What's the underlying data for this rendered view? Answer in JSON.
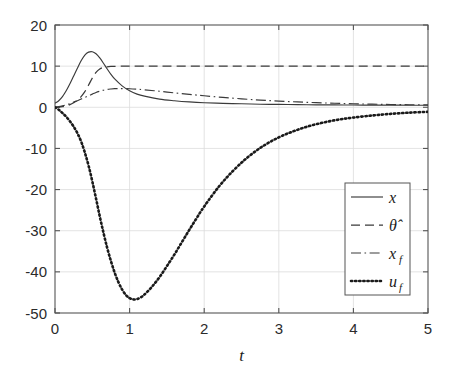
{
  "chart_data": {
    "type": "line",
    "title": "",
    "xlabel": "t",
    "ylabel": "",
    "xlim": [
      0,
      5
    ],
    "ylim": [
      -50,
      20
    ],
    "xticks": [
      "0",
      "1",
      "2",
      "3",
      "4",
      "5"
    ],
    "yticks": [
      "20",
      "10",
      "0",
      "-10",
      "-20",
      "-30",
      "-40",
      "-50"
    ],
    "xtick_values": [
      0,
      1,
      2,
      3,
      4,
      5
    ],
    "ytick_values": [
      20,
      10,
      0,
      -10,
      -20,
      -30,
      -40,
      -50
    ],
    "grid": true,
    "legend_position": "lower right",
    "series": [
      {
        "name": "x",
        "label": "x",
        "style": "solid",
        "color": "#3a3a3a",
        "x": [
          0,
          0.05,
          0.1,
          0.15,
          0.2,
          0.25,
          0.3,
          0.35,
          0.4,
          0.45,
          0.5,
          0.55,
          0.6,
          0.65,
          0.7,
          0.75,
          0.8,
          0.9,
          1.0,
          1.1,
          1.2,
          1.4,
          1.6,
          1.8,
          2.0,
          2.25,
          2.5,
          2.75,
          3.0,
          3.25,
          3.5,
          3.75,
          4.0,
          4.25,
          4.5,
          4.75,
          5.0
        ],
        "y": [
          1.0,
          1.6,
          2.6,
          4.0,
          5.7,
          7.6,
          9.5,
          11.3,
          12.7,
          13.4,
          13.5,
          13.0,
          12.0,
          10.7,
          9.3,
          8.0,
          6.9,
          5.2,
          4.0,
          3.2,
          2.7,
          2.0,
          1.6,
          1.3,
          1.1,
          0.95,
          0.85,
          0.75,
          0.7,
          0.65,
          0.6,
          0.58,
          0.55,
          0.53,
          0.52,
          0.5,
          0.5
        ]
      },
      {
        "name": "theta_hat",
        "label": "θ̂",
        "style": "dashed",
        "color": "#3a3a3a",
        "x": [
          0,
          0.05,
          0.1,
          0.15,
          0.2,
          0.25,
          0.3,
          0.35,
          0.4,
          0.45,
          0.5,
          0.55,
          0.6,
          0.65,
          0.7,
          0.75,
          0.8,
          0.9,
          1.0,
          1.25,
          1.5,
          2.0,
          2.5,
          3.0,
          3.5,
          4.0,
          4.5,
          5.0
        ],
        "y": [
          0.0,
          0.05,
          0.15,
          0.35,
          0.65,
          1.1,
          1.7,
          2.6,
          3.8,
          5.4,
          7.1,
          8.5,
          9.3,
          9.7,
          9.85,
          9.92,
          9.95,
          9.98,
          10.0,
          10.0,
          10.0,
          10.0,
          10.0,
          10.0,
          10.0,
          10.0,
          10.0,
          10.0
        ]
      },
      {
        "name": "x_f",
        "label": "x",
        "label_sub": "f",
        "style": "dashdot",
        "color": "#3a3a3a",
        "x": [
          0,
          0.05,
          0.1,
          0.15,
          0.2,
          0.25,
          0.3,
          0.35,
          0.4,
          0.45,
          0.5,
          0.55,
          0.6,
          0.65,
          0.7,
          0.75,
          0.8,
          0.85,
          0.9,
          1.0,
          1.1,
          1.2,
          1.4,
          1.6,
          1.8,
          2.0,
          2.25,
          2.5,
          2.75,
          3.0,
          3.25,
          3.5,
          3.75,
          4.0,
          4.25,
          4.5,
          4.75,
          5.0
        ],
        "y": [
          0.0,
          0.15,
          0.35,
          0.6,
          0.9,
          1.25,
          1.6,
          2.0,
          2.4,
          2.8,
          3.2,
          3.6,
          3.9,
          4.15,
          4.35,
          4.45,
          4.52,
          4.55,
          4.55,
          4.5,
          4.4,
          4.25,
          3.9,
          3.5,
          3.15,
          2.8,
          2.4,
          2.05,
          1.75,
          1.5,
          1.3,
          1.12,
          0.98,
          0.85,
          0.76,
          0.68,
          0.62,
          0.6
        ]
      },
      {
        "name": "u_f",
        "label": "u",
        "label_sub": "f",
        "style": "dotted",
        "color": "#1a1a1a",
        "x": [
          0,
          0.05,
          0.1,
          0.15,
          0.2,
          0.25,
          0.3,
          0.35,
          0.4,
          0.45,
          0.5,
          0.55,
          0.6,
          0.65,
          0.7,
          0.75,
          0.8,
          0.85,
          0.9,
          0.95,
          1.0,
          1.05,
          1.1,
          1.15,
          1.2,
          1.3,
          1.4,
          1.5,
          1.6,
          1.7,
          1.8,
          1.9,
          2.0,
          2.2,
          2.4,
          2.6,
          2.8,
          3.0,
          3.2,
          3.4,
          3.6,
          3.8,
          4.0,
          4.25,
          4.5,
          4.75,
          5.0
        ],
        "y": [
          0.0,
          -0.6,
          -1.4,
          -2.3,
          -3.4,
          -4.7,
          -6.3,
          -8.3,
          -11.0,
          -14.2,
          -18.0,
          -22.2,
          -26.5,
          -30.5,
          -34.2,
          -37.4,
          -40.2,
          -42.5,
          -44.3,
          -45.6,
          -46.4,
          -46.7,
          -46.6,
          -46.2,
          -45.5,
          -43.6,
          -41.3,
          -38.6,
          -35.8,
          -32.8,
          -29.8,
          -26.9,
          -24.1,
          -19.2,
          -15.2,
          -11.9,
          -9.3,
          -7.3,
          -5.8,
          -4.6,
          -3.7,
          -3.0,
          -2.5,
          -2.0,
          -1.6,
          -1.3,
          -1.1
        ]
      }
    ],
    "legend_entries": [
      {
        "label": "x",
        "sub": "",
        "style": "solid"
      },
      {
        "label": "θ̂",
        "sub": "",
        "style": "dashed"
      },
      {
        "label": "x",
        "sub": "f",
        "style": "dashdot"
      },
      {
        "label": "u",
        "sub": "f",
        "style": "dotted"
      }
    ]
  },
  "figure": {
    "background": "#ffffff",
    "axis_color": "#555555",
    "grid_color": "#dcdcdc",
    "plot_box": {
      "left": 55,
      "top": 25,
      "right": 428,
      "bottom": 313
    }
  }
}
